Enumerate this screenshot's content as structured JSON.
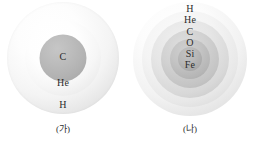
{
  "figure": {
    "background_color": "#ffffff",
    "panels": [
      {
        "id": "panel-a",
        "caption": "(가)",
        "shell_count": 3,
        "shells": [
          {
            "label": "H",
            "role": "outer-envelope",
            "fill": "#f2f2f2"
          },
          {
            "label": "He",
            "role": "middle-shell",
            "fill": "#ededed"
          },
          {
            "label": "C",
            "role": "core",
            "fill": "#b2b2b2"
          }
        ]
      },
      {
        "id": "panel-b",
        "caption": "(나)",
        "shell_count": 6,
        "shells": [
          {
            "label": "H",
            "role": "outer-envelope",
            "fill": "#f2f2f2"
          },
          {
            "label": "He",
            "role": "shell-2",
            "fill": "#e8e8e8"
          },
          {
            "label": "C",
            "role": "shell-3",
            "fill": "#d8d8d8"
          },
          {
            "label": "O",
            "role": "shell-4",
            "fill": "#c4c4c4"
          },
          {
            "label": "Si",
            "role": "shell-5",
            "fill": "#b6b6b6"
          },
          {
            "label": "Fe",
            "role": "core",
            "fill": "#ababab"
          }
        ]
      }
    ]
  }
}
